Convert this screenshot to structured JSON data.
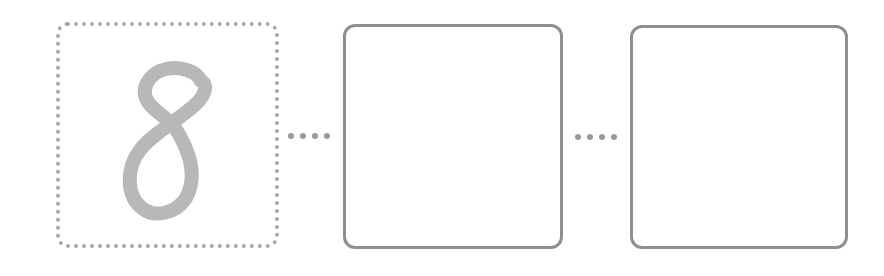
{
  "diagram": {
    "boxes": [
      {
        "id": "box1",
        "content": "8",
        "border_style": "dotted"
      },
      {
        "id": "box2",
        "content": "",
        "border_style": "solid"
      },
      {
        "id": "box3",
        "content": "",
        "border_style": "solid"
      }
    ],
    "connectors": [
      {
        "from": "box1",
        "to": "box2",
        "style": "dotted",
        "dot_count": 4
      },
      {
        "from": "box2",
        "to": "box3",
        "style": "dotted",
        "dot_count": 4
      }
    ],
    "colors": {
      "digit": "#b8b8b8",
      "dotted_border": "#a9a9a9",
      "solid_border": "#8f8f8f",
      "connector_dots": "#9a9a9a"
    }
  }
}
